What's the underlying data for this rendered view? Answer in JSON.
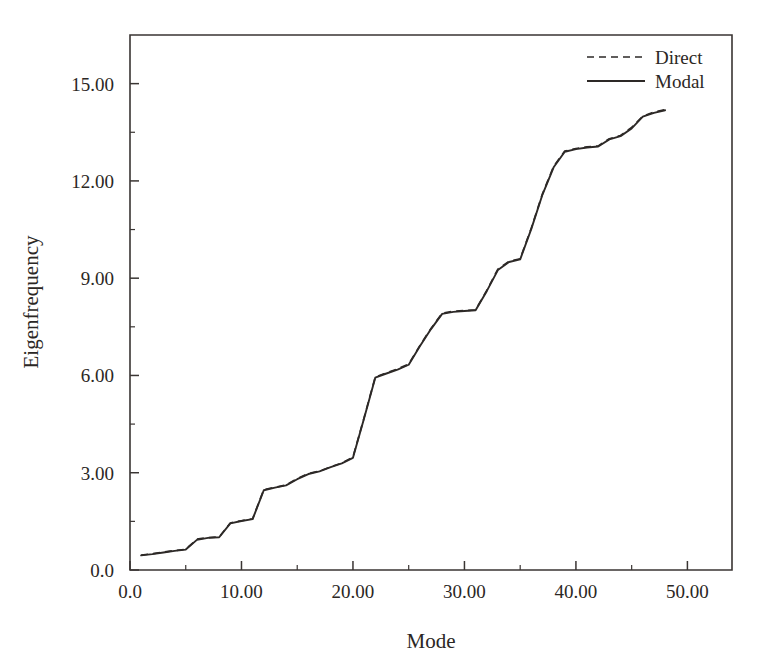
{
  "chart_data": {
    "type": "line",
    "title": "",
    "xlabel": "Mode",
    "ylabel": "Eigenfrequency",
    "xlim": [
      0,
      54
    ],
    "ylim": [
      0,
      16.5
    ],
    "grid": false,
    "legend_position": "top-right",
    "xticks": [
      0,
      10,
      20,
      30,
      40,
      50
    ],
    "xtick_labels": [
      "0.0",
      "10.00",
      "20.00",
      "30.00",
      "40.00",
      "50.00"
    ],
    "yticks": [
      0,
      3,
      6,
      9,
      12,
      15
    ],
    "ytick_labels": [
      "0.0",
      "3.00",
      "6.00",
      "9.00",
      "12.00",
      "15.00"
    ],
    "x_minor_step": 5,
    "y_minor_step": 1.5,
    "x": [
      1,
      2,
      3,
      4,
      5,
      6,
      7,
      8,
      9,
      10,
      11,
      12,
      13,
      14,
      15,
      16,
      17,
      18,
      19,
      20,
      21,
      22,
      23,
      24,
      25,
      26,
      27,
      28,
      29,
      30,
      31,
      32,
      33,
      34,
      35,
      36,
      37,
      38,
      39,
      40,
      41,
      42,
      43,
      44,
      45,
      46,
      47,
      48
    ],
    "series": [
      {
        "name": "Direct",
        "style": "dashed",
        "values": [
          0.46,
          0.5,
          0.55,
          0.6,
          0.64,
          0.95,
          1.0,
          1.02,
          1.45,
          1.52,
          1.58,
          2.48,
          2.55,
          2.62,
          2.82,
          2.98,
          3.05,
          3.18,
          3.3,
          3.48,
          4.7,
          5.95,
          6.08,
          6.2,
          6.35,
          6.92,
          7.45,
          7.92,
          7.98,
          8.0,
          8.02,
          8.62,
          9.28,
          9.52,
          9.6,
          10.55,
          11.6,
          12.45,
          12.92,
          13.0,
          13.05,
          13.08,
          13.3,
          13.4,
          13.65,
          14.0,
          14.12,
          14.2
        ]
      },
      {
        "name": "Modal",
        "style": "solid",
        "values": [
          0.45,
          0.49,
          0.54,
          0.59,
          0.63,
          0.93,
          0.99,
          1.01,
          1.44,
          1.51,
          1.57,
          2.46,
          2.54,
          2.61,
          2.8,
          2.96,
          3.04,
          3.17,
          3.29,
          3.46,
          4.68,
          5.93,
          6.06,
          6.18,
          6.33,
          6.9,
          7.43,
          7.9,
          7.96,
          7.99,
          8.01,
          8.6,
          9.25,
          9.5,
          9.58,
          10.52,
          11.58,
          12.42,
          12.9,
          12.98,
          13.03,
          13.06,
          13.28,
          13.38,
          13.62,
          13.98,
          14.1,
          14.18
        ]
      }
    ]
  },
  "legend": {
    "entries": [
      {
        "label": "Direct",
        "style": "dashed"
      },
      {
        "label": "Modal",
        "style": "solid"
      }
    ]
  }
}
